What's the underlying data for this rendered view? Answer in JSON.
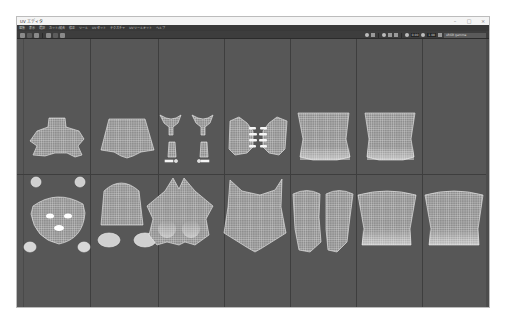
{
  "window": {
    "title": "UV エディタ",
    "controls": [
      "minimize",
      "maximize",
      "close"
    ]
  },
  "menubar": {
    "items": [
      {
        "label": "編集"
      },
      {
        "label": "表示"
      },
      {
        "label": "選択"
      },
      {
        "label": "カット/縫合"
      },
      {
        "label": "修正"
      },
      {
        "label": "ツール"
      },
      {
        "label": "UV セット"
      },
      {
        "label": "テクスチャ"
      },
      {
        "label": "UV ツールキット"
      },
      {
        "label": "ヘルプ"
      }
    ]
  },
  "toolbar": {
    "left_buttons": [
      "image-toggle",
      "checker-toggle",
      "shaded-toggle",
      "grid-toggle",
      "snap-toggle",
      "isolate-toggle"
    ],
    "right": {
      "exposure_value": "0.00",
      "gamma_value": "1.00",
      "colorspace_label": "sRGB gamma"
    }
  },
  "canvas": {
    "grid": {
      "columns": 7,
      "rows": 2,
      "vertical_lines_x": [
        73,
        141,
        207,
        273,
        339,
        405
      ],
      "horizontal_line_y": 135
    },
    "colors": {
      "background": "#575757",
      "grid_line": "#3e3e3e",
      "uv_wire": "#e6e6e6"
    },
    "shells": [
      {
        "name": "torso-front-upper",
        "tile": "0,1"
      },
      {
        "name": "torso-back-upper",
        "tile": "1,1"
      },
      {
        "name": "arms-pair",
        "tile": "2,1"
      },
      {
        "name": "hands-pair",
        "tile": "3,1"
      },
      {
        "name": "leg-upper-left",
        "tile": "4,1"
      },
      {
        "name": "leg-upper-right",
        "tile": "5,1"
      },
      {
        "name": "face",
        "tile": "0,0"
      },
      {
        "name": "head-back",
        "tile": "1,0"
      },
      {
        "name": "ears",
        "tile": "1,0"
      },
      {
        "name": "chest",
        "tile": "2,0"
      },
      {
        "name": "belly",
        "tile": "3,0"
      },
      {
        "name": "shins",
        "tile": "4,0"
      },
      {
        "name": "hip-front",
        "tile": "5,0"
      },
      {
        "name": "hip-back",
        "tile": "6,0"
      }
    ]
  }
}
